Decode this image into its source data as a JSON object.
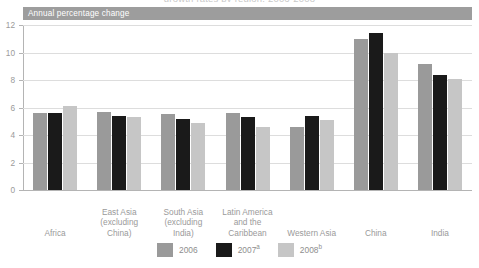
{
  "figure": {
    "subtitle": "Annual percentage change",
    "clipped_top_text": "growth rates by region, 2006-2008"
  },
  "legend": {
    "position": "bottom-center",
    "items": [
      {
        "label": "2006",
        "sup": "",
        "color": "#9a9a9a"
      },
      {
        "label": "2007",
        "sup": "a",
        "color": "#1a1a1a"
      },
      {
        "label": "2008",
        "sup": "b",
        "color": "#c6c6c6"
      }
    ]
  },
  "y_axis": {
    "ticks": [
      "0",
      "2",
      "4",
      "6",
      "8",
      "10",
      "12"
    ],
    "min": 0,
    "max": 12
  },
  "chart_data": {
    "type": "bar",
    "title": "",
    "subtitle": "Annual percentage change",
    "xlabel": "",
    "ylabel": "Annual percentage change",
    "ylim": [
      0,
      12
    ],
    "yticks": [
      0,
      2,
      4,
      6,
      8,
      10,
      12
    ],
    "grid": true,
    "legend_position": "bottom-center",
    "categories": [
      "Africa",
      "East Asia (excluding China)",
      "South Asia (excluding India)",
      "Latin America and the Caribbean",
      "Western Asia",
      "China",
      "India"
    ],
    "category_labels_multiline": [
      [
        "Africa"
      ],
      [
        "East Asia",
        "(excluding",
        "China)"
      ],
      [
        "South Asia",
        "(excluding",
        "India)"
      ],
      [
        "Latin America",
        "and the",
        "Caribbean"
      ],
      [
        "Western Asia"
      ],
      [
        "China"
      ],
      [
        "India"
      ]
    ],
    "series": [
      {
        "name": "2006",
        "color": "#9a9a9a",
        "values": [
          5.6,
          5.7,
          5.5,
          5.6,
          4.6,
          11.0,
          9.2
        ]
      },
      {
        "name": "2007a",
        "color": "#1a1a1a",
        "values": [
          5.6,
          5.4,
          5.2,
          5.3,
          5.4,
          11.4,
          8.4
        ]
      },
      {
        "name": "2008b",
        "color": "#c6c6c6",
        "values": [
          6.1,
          5.3,
          4.9,
          4.6,
          5.1,
          10.0,
          8.1
        ]
      }
    ]
  }
}
